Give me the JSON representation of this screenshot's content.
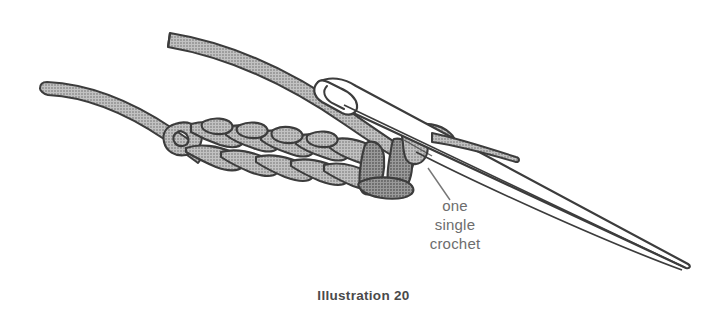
{
  "figure": {
    "caption": "Illustration 20",
    "background_color": "#ffffff",
    "annotation": {
      "line1": "one",
      "line2": "single",
      "line3": "crochet",
      "text_color": "#6d6d6d"
    },
    "colors": {
      "yarn_fill": "#b2b2b2",
      "yarn_fill_dark": "#8a8a8a",
      "outline": "#3c3c3c",
      "hook_fill": "#ffffff",
      "leader_line": "#777777",
      "caption_color": "#4a4a4a"
    },
    "elements": {
      "working_yarn_label": "working yarn strand",
      "yarn_tail_label": "yarn tail",
      "foundation_chain_label": "foundation chain",
      "hook_label": "crochet hook",
      "highlighted_stitch_label": "one single crochet"
    }
  }
}
